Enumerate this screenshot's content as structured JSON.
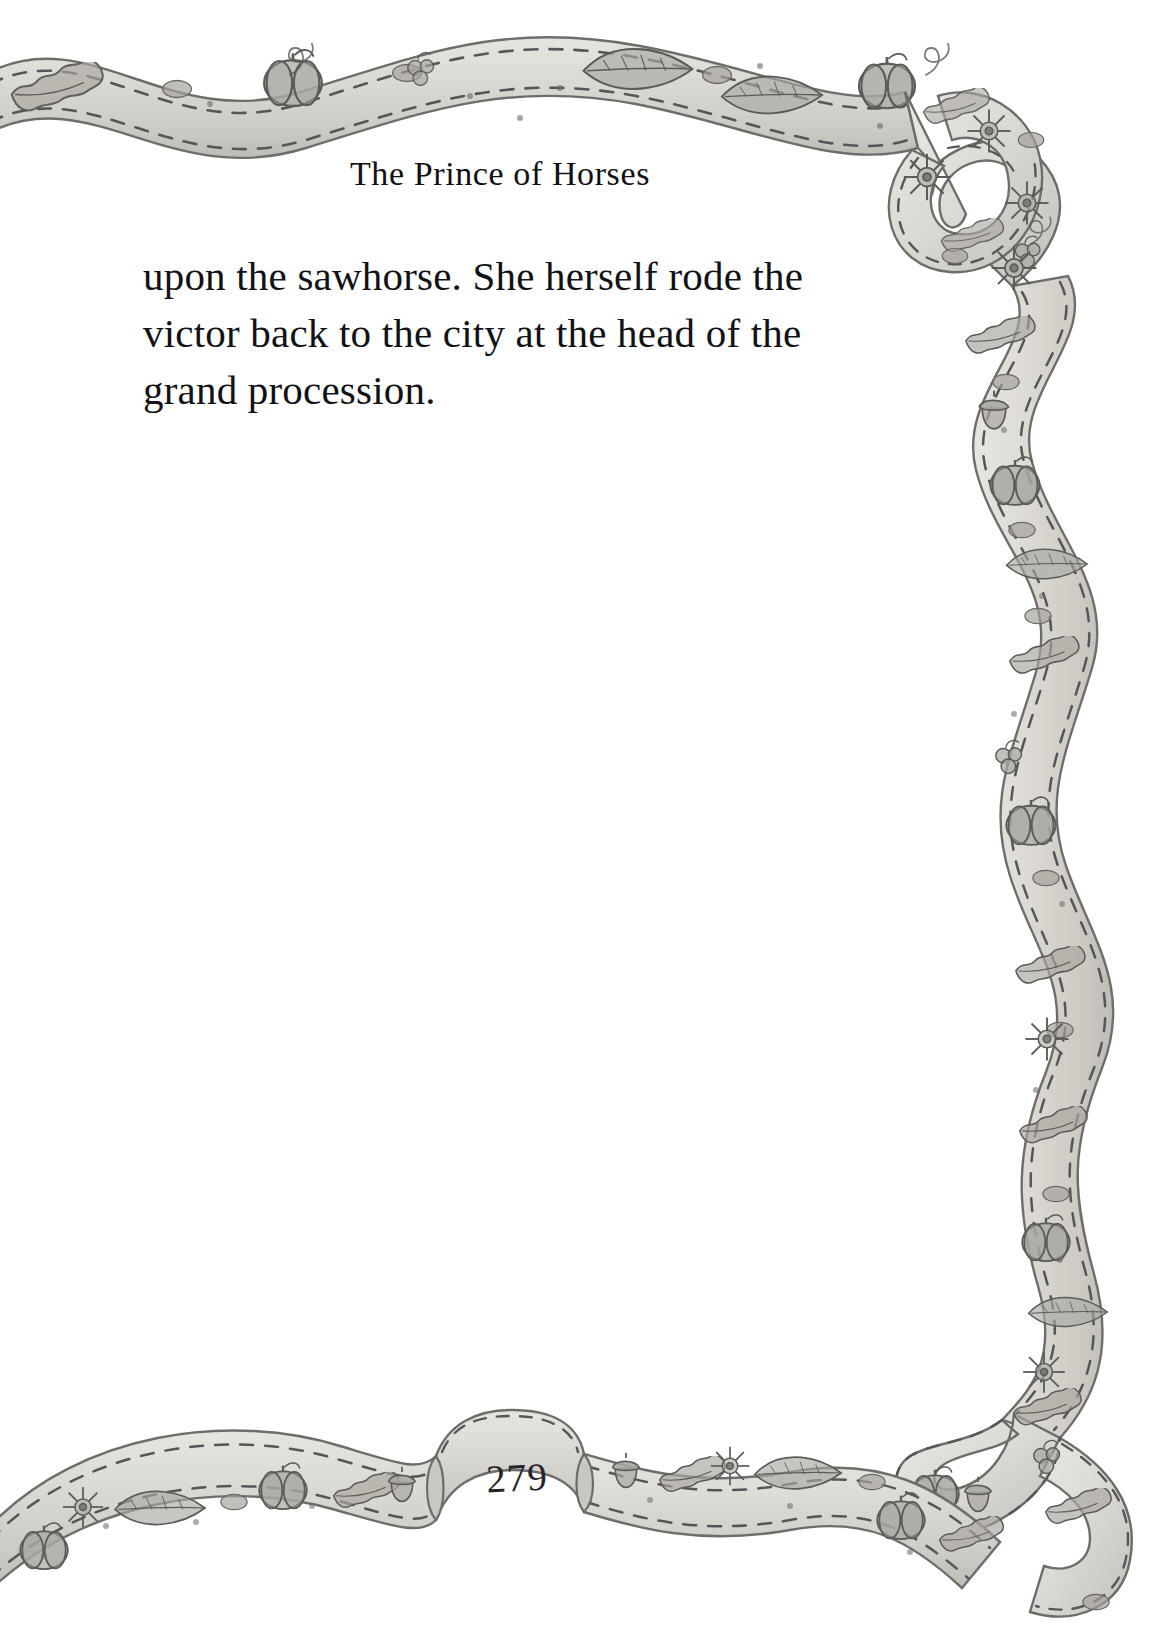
{
  "page": {
    "background_color": "#ffffff",
    "width": 1161,
    "height": 1641
  },
  "running_head": {
    "text": "The Prince of Horses"
  },
  "body": {
    "lines": [
      "upon the sawhorse. She herself rode the",
      "victor back to the city at the head of the",
      "grand procession."
    ],
    "paragraph": "upon the sawhorse. She herself rode the victor back to the city at the head of the grand procession.",
    "text_color": "#121115"
  },
  "folio": {
    "page_number": "279"
  },
  "decoration": {
    "style": "hand-drawn watercolor ribbon border, grayscale",
    "ribbon_fill": "#dedcd6",
    "ribbon_shade": "#b9b7b1",
    "ribbon_outline": "#6e6c69",
    "motif_fill": "#a9a7a1",
    "motif_outline": "#5d5b58",
    "stitch_color": "#57555a",
    "motifs": [
      "pumpkin",
      "oak-leaf",
      "feather-leaf",
      "sunflower",
      "acorn",
      "berry-cluster",
      "seed-dot",
      "tendril-curl"
    ],
    "regions": [
      "top-wavy-ribbon",
      "top-right-ribbon-curl",
      "right-serpentine-ribbon",
      "bottom-right-ribbon-knot",
      "bottom-wavy-ribbon",
      "bottom-center-folio-banner"
    ]
  }
}
